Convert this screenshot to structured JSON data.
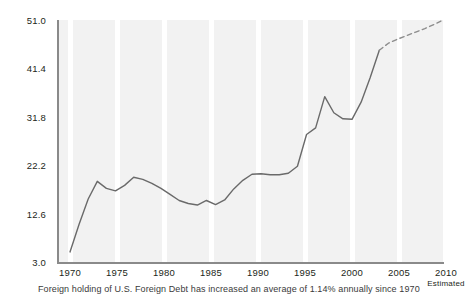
{
  "chart_data": {
    "type": "line",
    "title": "",
    "xlabel": "",
    "ylabel": "",
    "xlim": [
      1970,
      2011
    ],
    "ylim": [
      3.0,
      51.0
    ],
    "grid": "vertical-bands",
    "legend": "none",
    "x_tick_labels": [
      "1970",
      "1975",
      "1980",
      "1985",
      "1990",
      "1995",
      "2000",
      "2005",
      "2010"
    ],
    "x_ticks": [
      1970,
      1975,
      1980,
      1985,
      1990,
      1995,
      2000,
      2005,
      2010
    ],
    "y_tick_labels": [
      "3.0",
      "12.6",
      "22.2",
      "31.8",
      "41.4",
      "51.0"
    ],
    "y_ticks": [
      3.0,
      12.6,
      22.2,
      31.8,
      41.4,
      51.0
    ],
    "annotations": [
      "Estimated"
    ],
    "series": [
      {
        "name": "Foreign holding of U.S. Foreign Debt",
        "style": "solid",
        "x": [
          1970,
          1971,
          1972,
          1973,
          1974,
          1975,
          1976,
          1977,
          1978,
          1979,
          1980,
          1981,
          1982,
          1983,
          1984,
          1985,
          1986,
          1987,
          1988,
          1989,
          1990,
          1991,
          1992,
          1993,
          1994,
          1995,
          1996,
          1997,
          1998,
          1999,
          2000,
          2001,
          2002,
          2003,
          2004
        ],
        "values": [
          5.0,
          10.5,
          15.5,
          19.0,
          17.6,
          17.1,
          18.2,
          19.8,
          19.4,
          18.6,
          17.6,
          16.4,
          15.2,
          14.6,
          14.3,
          15.2,
          14.4,
          15.3,
          17.5,
          19.2,
          20.4,
          20.5,
          20.3,
          20.3,
          20.6,
          22.0,
          28.3,
          29.6,
          35.8,
          32.6,
          31.4,
          31.3,
          34.7,
          39.6,
          45.0
        ]
      },
      {
        "name": "Estimated projection",
        "style": "dashed",
        "x": [
          2004,
          2005,
          2006,
          2007,
          2008,
          2009,
          2010,
          2011
        ],
        "values": [
          45.0,
          46.4,
          47.2,
          47.9,
          48.6,
          49.3,
          50.1,
          51.0
        ]
      }
    ],
    "caption": "Foreign holding of U.S. Foreign Debt has increased an average of 1.14% annually since 1970",
    "colors": {
      "line": "#6a6a6a",
      "plot_background": "#f2f2f2",
      "band": "#ffffff",
      "axis": "#8a8a8a",
      "text": "#231f20"
    }
  }
}
